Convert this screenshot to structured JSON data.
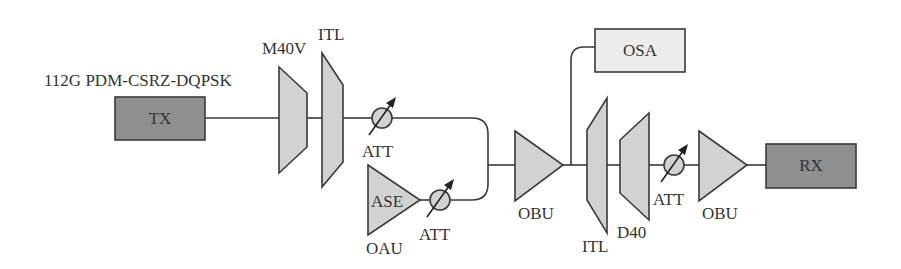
{
  "diagram": {
    "title": "112G PDM-CSRZ-DQPSK",
    "colors": {
      "endpoint_fill": "#8f8f8f",
      "monitor_fill": "#ececec",
      "component_fill": "#d2d2d2",
      "stroke": "#3a3a3a"
    },
    "nodes": {
      "tx": {
        "label": "TX",
        "type": "transmitter"
      },
      "m40v": {
        "label": "M40V",
        "type": "multiplexer"
      },
      "itl_tx": {
        "label": "ITL",
        "type": "interleaver"
      },
      "att1": {
        "label": "ATT",
        "type": "variable-attenuator"
      },
      "ase": {
        "label": "ASE",
        "type": "amplifier-noise-source"
      },
      "oau": {
        "label": "OAU",
        "type": "amplifier-label"
      },
      "att2": {
        "label": "ATT",
        "type": "variable-attenuator"
      },
      "obu1": {
        "label": "OBU",
        "type": "amplifier"
      },
      "osa": {
        "label": "OSA",
        "type": "spectrum-analyzer"
      },
      "itl_rx": {
        "label": "ITL",
        "type": "interleaver"
      },
      "d40": {
        "label": "D40",
        "type": "demultiplexer"
      },
      "att3": {
        "label": "ATT",
        "type": "variable-attenuator"
      },
      "obu2": {
        "label": "OBU",
        "type": "amplifier"
      },
      "rx": {
        "label": "RX",
        "type": "receiver"
      }
    },
    "edges": [
      [
        "TX",
        "M40V"
      ],
      [
        "M40V",
        "ITL"
      ],
      [
        "ITL",
        "ATT"
      ],
      [
        "ATT",
        "coupler"
      ],
      [
        "ASE (OAU)",
        "ATT"
      ],
      [
        "ATT",
        "coupler"
      ],
      [
        "coupler",
        "OBU"
      ],
      [
        "OBU",
        "OSA"
      ],
      [
        "OBU",
        "ITL"
      ],
      [
        "ITL",
        "D40"
      ],
      [
        "D40",
        "ATT"
      ],
      [
        "ATT",
        "OBU"
      ],
      [
        "OBU",
        "RX"
      ]
    ]
  }
}
